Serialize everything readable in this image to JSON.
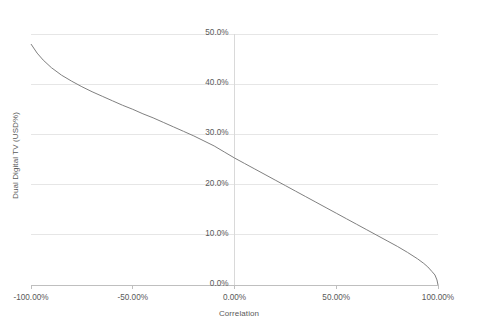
{
  "chart_data": {
    "type": "line",
    "title": "",
    "xlabel": "Correlation",
    "ylabel": "Dual Digital TV (USD%)",
    "xlim": [
      -100,
      100
    ],
    "ylim": [
      0,
      50
    ],
    "grid": true,
    "grid_axis": "y",
    "legend": "none",
    "line_color": "#808080",
    "x_tick_labels": [
      "-100.00%",
      "-50.00%",
      "0.00%",
      "50.00%",
      "100.00%"
    ],
    "x_tick_values": [
      -100,
      -50,
      0,
      50,
      100
    ],
    "y_tick_labels": [
      "0.0%",
      "10.0%",
      "20.0%",
      "30.0%",
      "40.0%",
      "50.0%"
    ],
    "y_tick_values": [
      0,
      10,
      20,
      30,
      40,
      50
    ],
    "series": [
      {
        "name": "Dual Digital TV (USD%)",
        "x": [
          -100,
          -97,
          -94,
          -90,
          -85,
          -80,
          -75,
          -70,
          -65,
          -60,
          -55,
          -50,
          -45,
          -40,
          -35,
          -30,
          -25,
          -20,
          -15,
          -10,
          -5,
          0,
          5,
          10,
          15,
          20,
          25,
          30,
          35,
          40,
          45,
          50,
          55,
          60,
          65,
          70,
          75,
          80,
          85,
          90,
          93,
          95,
          97,
          98.5,
          99.5,
          100
        ],
        "y": [
          48.0,
          46.2,
          44.8,
          43.3,
          41.8,
          40.6,
          39.5,
          38.5,
          37.6,
          36.7,
          35.8,
          35.0,
          34.1,
          33.3,
          32.4,
          31.5,
          30.6,
          29.7,
          28.7,
          27.7,
          26.5,
          25.3,
          24.2,
          23.1,
          22.0,
          20.9,
          19.8,
          18.7,
          17.6,
          16.5,
          15.4,
          14.3,
          13.2,
          12.1,
          11.0,
          9.9,
          8.8,
          7.7,
          6.5,
          5.2,
          4.3,
          3.6,
          2.7,
          2.0,
          1.0,
          0.0
        ]
      }
    ]
  },
  "footer": {
    "caption": ""
  }
}
